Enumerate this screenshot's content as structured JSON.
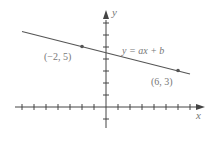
{
  "chart_data": {
    "type": "line",
    "title": "",
    "xlabel": "x",
    "ylabel": "y",
    "equation_label": "y = ax + b",
    "points": [
      {
        "x": -2,
        "y": 5,
        "label": "(−2, 5)"
      },
      {
        "x": 6,
        "y": 3,
        "label": "(6, 3)"
      }
    ],
    "line": {
      "slope": -0.25,
      "intercept": 4.5,
      "x_range": [
        -7,
        7
      ]
    },
    "x_ticks": [
      -7,
      -6,
      -5,
      -4,
      -3,
      -2,
      -1,
      1,
      2,
      3,
      4,
      5,
      6,
      7
    ],
    "y_ticks": [
      -1,
      1,
      2,
      3,
      4,
      5,
      6,
      7
    ],
    "xlim": [
      -7.5,
      8
    ],
    "ylim": [
      -2,
      8
    ],
    "grid": false,
    "tick_labels_shown": false,
    "colors": {
      "line": "#555555",
      "axis": "#444444",
      "text": "#777777"
    }
  }
}
